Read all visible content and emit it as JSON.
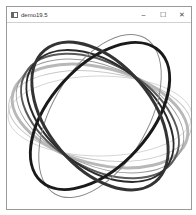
{
  "window": {
    "title": "demo19.5",
    "controls": {
      "minimize": "–",
      "maximize": "☐",
      "close": "✕"
    }
  },
  "canvas": {
    "background": "#ffffff",
    "center": [
      93,
      94
    ],
    "ellipses": [
      {
        "rx": 92,
        "ry": 40,
        "angle": 0,
        "stroke": "#d6d6d6",
        "width": 1
      },
      {
        "rx": 92,
        "ry": 44,
        "angle": 8,
        "stroke": "#c8c8c8",
        "width": 1
      },
      {
        "rx": 90,
        "ry": 48,
        "angle": 15,
        "stroke": "#b8b8b8",
        "width": 3
      },
      {
        "rx": 88,
        "ry": 50,
        "angle": 22,
        "stroke": "#9a9a9a",
        "width": 1
      },
      {
        "rx": 86,
        "ry": 52,
        "angle": 30,
        "stroke": "#5a5a5a",
        "width": 2
      },
      {
        "rx": 84,
        "ry": 52,
        "angle": 38,
        "stroke": "#2a2a2a",
        "width": 2
      },
      {
        "rx": 90,
        "ry": 48,
        "angle": -60,
        "stroke": "#8a8a8a",
        "width": 1
      },
      {
        "rx": 88,
        "ry": 50,
        "angle": -48,
        "stroke": "#1a1a1a",
        "width": 3
      },
      {
        "rx": 86,
        "ry": 52,
        "angle": 50,
        "stroke": "#333333",
        "width": 3
      }
    ]
  }
}
